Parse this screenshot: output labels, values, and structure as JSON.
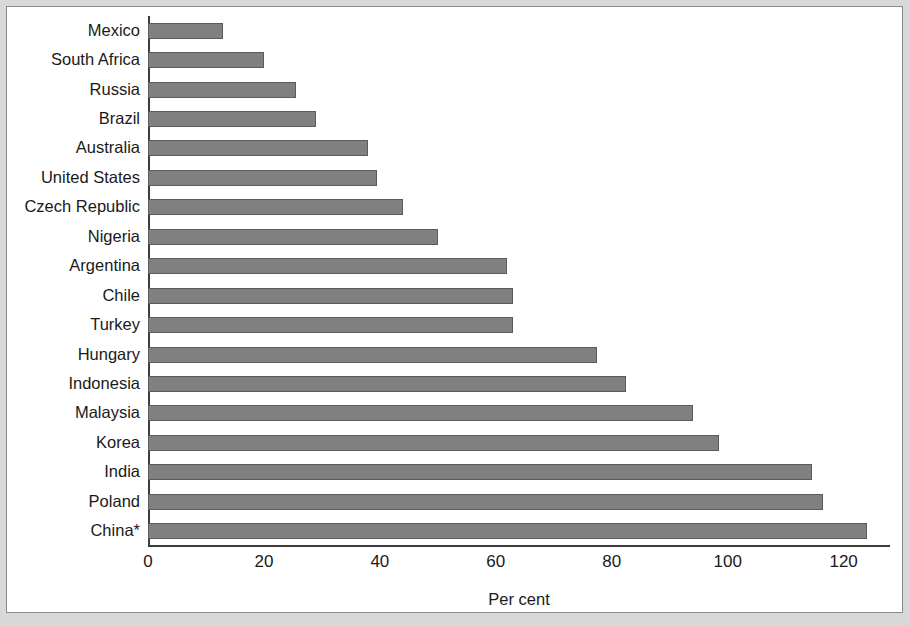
{
  "chart_data": {
    "type": "bar",
    "orientation": "horizontal",
    "title": "",
    "xlabel": "Per cent",
    "ylabel": "",
    "xlim": [
      0,
      128
    ],
    "xticks": [
      0,
      20,
      40,
      60,
      80,
      100,
      120
    ],
    "grid": false,
    "legend": null,
    "bar_color": "#808080",
    "bar_edge_color": "#5b5b5b",
    "axis_color": "#3c3c3c",
    "categories": [
      "Mexico",
      "South Africa",
      "Russia",
      "Brazil",
      "Australia",
      "United States",
      "Czech Republic",
      "Nigeria",
      "Argentina",
      "Chile",
      "Turkey",
      "Hungary",
      "Indonesia",
      "Malaysia",
      "Korea",
      "India",
      "Poland",
      "China*"
    ],
    "values": [
      13,
      20,
      25.5,
      29,
      38,
      39.5,
      44,
      50,
      62,
      63,
      63,
      77.5,
      82.5,
      94,
      98.5,
      114.5,
      116.5,
      124
    ]
  }
}
